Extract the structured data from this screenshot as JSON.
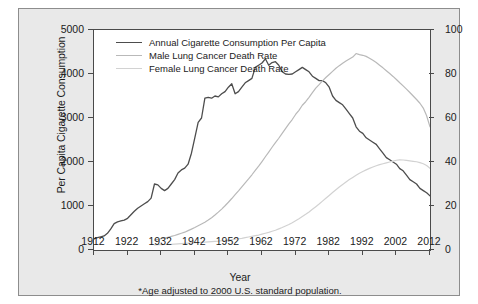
{
  "chart_data": {
    "type": "line",
    "title": "",
    "xlabel": "Year",
    "ylabel": "Per Capita Cigarette Consumption",
    "y2label": "Age-Adjusted Lung Cancer Death Rates*",
    "footnote": "*Age adjusted to 2000 U.S. standard population.",
    "xlim": [
      1912,
      2012
    ],
    "ylim": [
      0,
      5000
    ],
    "y2lim": [
      0,
      100
    ],
    "xticks": [
      1912,
      1922,
      1932,
      1942,
      1952,
      1962,
      1972,
      1982,
      1992,
      2002,
      2012
    ],
    "yticks": [
      0,
      1000,
      2000,
      3000,
      4000,
      5000
    ],
    "y2ticks": [
      0,
      20,
      40,
      60,
      80,
      100
    ],
    "grid": false,
    "legend_position": "top-left",
    "colors": {
      "consumption": "#4d4d4d",
      "male": "#b9b9b9",
      "female": "#d2d2d2",
      "panel_background": "#e9e9e9",
      "plot_background": "#ffffff",
      "axis": "#4a4a4a",
      "text": "#1b1b1b"
    },
    "series": [
      {
        "name": "Annual Cigarette Consumption Per Capita",
        "axis": "left",
        "style": "solid",
        "x": [
          1912,
          1913,
          1914,
          1915,
          1916,
          1917,
          1918,
          1919,
          1920,
          1921,
          1922,
          1923,
          1924,
          1925,
          1926,
          1927,
          1928,
          1929,
          1930,
          1931,
          1932,
          1933,
          1934,
          1935,
          1936,
          1937,
          1938,
          1939,
          1940,
          1941,
          1942,
          1943,
          1944,
          1945,
          1946,
          1947,
          1948,
          1949,
          1950,
          1951,
          1952,
          1953,
          1954,
          1955,
          1956,
          1957,
          1958,
          1959,
          1960,
          1961,
          1962,
          1963,
          1964,
          1965,
          1966,
          1967,
          1968,
          1969,
          1970,
          1971,
          1972,
          1973,
          1974,
          1975,
          1976,
          1977,
          1978,
          1979,
          1980,
          1981,
          1982,
          1983,
          1984,
          1985,
          1986,
          1987,
          1988,
          1989,
          1990,
          1991,
          1992,
          1993,
          1994,
          1995,
          1996,
          1997,
          1998,
          1999,
          2000,
          2001,
          2002,
          2003,
          2004,
          2005,
          2006,
          2007,
          2008,
          2009,
          2010,
          2011,
          2012
        ],
        "values": [
          250,
          280,
          300,
          320,
          380,
          480,
          600,
          640,
          660,
          680,
          720,
          800,
          880,
          950,
          1000,
          1050,
          1100,
          1180,
          1500,
          1480,
          1400,
          1350,
          1400,
          1500,
          1600,
          1750,
          1820,
          1860,
          1950,
          2200,
          2550,
          2900,
          3000,
          3450,
          3470,
          3450,
          3500,
          3480,
          3550,
          3600,
          3700,
          3780,
          3550,
          3600,
          3700,
          3800,
          3850,
          3900,
          4150,
          4200,
          4250,
          4345,
          4200,
          4260,
          4280,
          4200,
          4050,
          4000,
          3990,
          4000,
          4050,
          4100,
          4150,
          4100,
          4050,
          3950,
          3900,
          3850,
          3850,
          3800,
          3700,
          3500,
          3400,
          3350,
          3300,
          3200,
          3100,
          3000,
          2800,
          2700,
          2650,
          2550,
          2500,
          2450,
          2400,
          2300,
          2200,
          2100,
          2050,
          2000,
          1950,
          1850,
          1800,
          1700,
          1600,
          1550,
          1500,
          1400,
          1350,
          1300,
          1230
        ]
      },
      {
        "name": "Male Lung Cancer Death Rate",
        "axis": "right",
        "style": "solid",
        "x": [
          1930,
          1931,
          1932,
          1933,
          1934,
          1935,
          1936,
          1937,
          1938,
          1939,
          1940,
          1941,
          1942,
          1943,
          1944,
          1945,
          1946,
          1947,
          1948,
          1949,
          1950,
          1951,
          1952,
          1953,
          1954,
          1955,
          1956,
          1957,
          1958,
          1959,
          1960,
          1961,
          1962,
          1963,
          1964,
          1965,
          1966,
          1967,
          1968,
          1969,
          1970,
          1971,
          1972,
          1973,
          1974,
          1975,
          1976,
          1977,
          1978,
          1979,
          1980,
          1981,
          1982,
          1983,
          1984,
          1985,
          1986,
          1987,
          1988,
          1989,
          1990,
          1991,
          1992,
          1993,
          1994,
          1995,
          1996,
          1997,
          1998,
          1999,
          2000,
          2001,
          2002,
          2003,
          2004,
          2005,
          2006,
          2007,
          2008,
          2009,
          2010,
          2011,
          2012
        ],
        "values": [
          4.5,
          4.8,
          5.1,
          5.4,
          5.8,
          6.2,
          6.6,
          7.1,
          7.6,
          8.1,
          8.8,
          9.5,
          10.2,
          11.0,
          11.8,
          12.6,
          13.6,
          14.7,
          15.9,
          17.2,
          18.6,
          20.1,
          21.7,
          23.4,
          25.2,
          26.9,
          28.7,
          30.5,
          32.3,
          34.2,
          36.2,
          38.1,
          40.2,
          42.4,
          44.5,
          46.7,
          48.8,
          50.8,
          53.0,
          55.2,
          57.3,
          59.3,
          61.6,
          63.5,
          65.8,
          67.4,
          69.4,
          71.5,
          73.6,
          75.2,
          76.9,
          78.4,
          79.8,
          81.2,
          82.6,
          83.8,
          84.9,
          85.9,
          86.8,
          87.7,
          89.3,
          88.8,
          88.5,
          88.0,
          87.2,
          86.2,
          85.2,
          84.0,
          82.8,
          81.5,
          80.2,
          78.9,
          77.5,
          76.0,
          74.6,
          73.1,
          71.6,
          70.0,
          68.4,
          66.7,
          64.5,
          61.0,
          56.0
        ]
      },
      {
        "name": "Female Lung Cancer Death Rate",
        "axis": "right",
        "style": "solid",
        "x": [
          1930,
          1931,
          1932,
          1933,
          1934,
          1935,
          1936,
          1937,
          1938,
          1939,
          1940,
          1941,
          1942,
          1943,
          1944,
          1945,
          1946,
          1947,
          1948,
          1949,
          1950,
          1951,
          1952,
          1953,
          1954,
          1955,
          1956,
          1957,
          1958,
          1959,
          1960,
          1961,
          1962,
          1963,
          1964,
          1965,
          1966,
          1967,
          1968,
          1969,
          1970,
          1971,
          1972,
          1973,
          1974,
          1975,
          1976,
          1977,
          1978,
          1979,
          1980,
          1981,
          1982,
          1983,
          1984,
          1985,
          1986,
          1987,
          1988,
          1989,
          1990,
          1991,
          1992,
          1993,
          1994,
          1995,
          1996,
          1997,
          1998,
          1999,
          2000,
          2001,
          2002,
          2003,
          2004,
          2005,
          2006,
          2007,
          2008,
          2009,
          2010,
          2011,
          2012
        ],
        "values": [
          2.3,
          2.4,
          2.4,
          2.5,
          2.5,
          2.6,
          2.7,
          2.8,
          2.9,
          3.0,
          3.1,
          3.2,
          3.3,
          3.4,
          3.5,
          3.6,
          3.7,
          3.8,
          3.9,
          4.0,
          4.2,
          4.3,
          4.5,
          4.7,
          4.9,
          5.1,
          5.3,
          5.6,
          5.9,
          6.2,
          6.5,
          6.8,
          7.2,
          7.6,
          8.0,
          8.5,
          9.0,
          9.6,
          10.2,
          10.9,
          11.6,
          12.4,
          13.3,
          14.2,
          15.2,
          16.2,
          17.3,
          18.5,
          19.7,
          20.9,
          22.2,
          23.5,
          24.8,
          26.1,
          27.4,
          28.6,
          29.8,
          30.9,
          32.0,
          33.0,
          34.0,
          34.9,
          35.7,
          36.4,
          37.1,
          37.7,
          38.3,
          38.8,
          39.2,
          39.6,
          40.0,
          40.4,
          40.8,
          41.0,
          40.9,
          40.7,
          40.5,
          40.3,
          40.1,
          39.7,
          39.2,
          38.4,
          37.1
        ]
      }
    ]
  },
  "legend": {
    "items": [
      {
        "label": "Annual Cigarette Consumption Per Capita",
        "key": "consumption"
      },
      {
        "label": "Male Lung Cancer Death Rate",
        "key": "male"
      },
      {
        "label": "Female Lung Cancer Death Rate",
        "key": "female"
      }
    ]
  },
  "axes": {
    "left_title": "Per Capita Cigarette Consumption",
    "right_title": "Age-Adjusted Lung Cancer Death Rates*",
    "x_title": "Year"
  },
  "footnote": "*Age adjusted to 2000 U.S. standard population."
}
